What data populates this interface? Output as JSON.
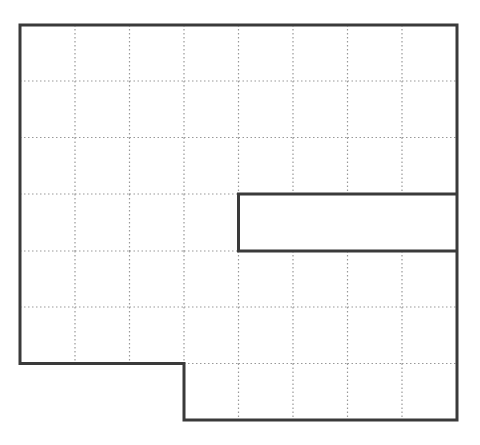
{
  "diagram": {
    "type": "grid-polygon",
    "grid": {
      "columns": 8,
      "rows": 7,
      "x_lines": [
        20,
        75,
        129.5,
        184,
        238.5,
        293,
        347.5,
        402,
        457
      ],
      "y_lines": [
        25,
        81,
        137.5,
        194,
        251,
        307,
        363.5,
        420
      ],
      "line_color": "#999999",
      "line_style": "dotted"
    },
    "outline": {
      "color": "#3a3a3a",
      "stroke_width": 3,
      "vertices_grid": [
        [
          0,
          0
        ],
        [
          8,
          0
        ],
        [
          8,
          4
        ],
        [
          4,
          4
        ],
        [
          4,
          3
        ],
        [
          8,
          3
        ],
        [
          8,
          7
        ],
        [
          3,
          7
        ],
        [
          3,
          6
        ],
        [
          0,
          6
        ]
      ],
      "note": "Outline vertices in (col,row) grid units; notch cut from right side between rows 3 and 4 for columns 4-8"
    }
  }
}
